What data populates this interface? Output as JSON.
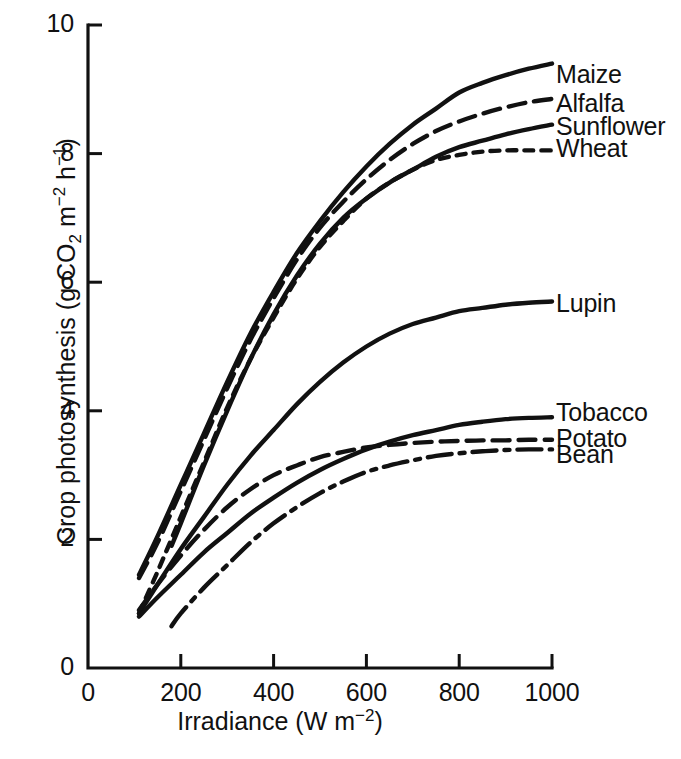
{
  "chart_data": {
    "type": "line",
    "title": "",
    "xlabel": "Irradiance (W m−2)",
    "ylabel": "Crop photosynthesis (g CO2 m−2 h−1)",
    "xlim": [
      0,
      1000
    ],
    "ylim": [
      0,
      10
    ],
    "xticks": [
      0,
      200,
      400,
      600,
      800,
      1000
    ],
    "yticks": [
      0,
      2,
      4,
      6,
      8,
      10
    ],
    "xtick_labels": [
      "0",
      "200",
      "400",
      "600",
      "800",
      "1000"
    ],
    "ytick_labels": [
      "0",
      "2",
      "4",
      "6",
      "8",
      "10"
    ],
    "grid": false,
    "legend_position": "right-of-curve-ends",
    "units": {
      "x": "W m-2",
      "y": "g CO2 m-2 h-1"
    },
    "series": [
      {
        "name": "Maize",
        "line_style": "solid",
        "label_x": 1010,
        "label_y": 9.2,
        "x": [
          110,
          150,
          200,
          250,
          300,
          350,
          400,
          450,
          500,
          550,
          600,
          650,
          700,
          750,
          800,
          850,
          900,
          950,
          1000
        ],
        "y": [
          1.45,
          2.05,
          2.85,
          3.65,
          4.45,
          5.2,
          5.85,
          6.45,
          6.95,
          7.4,
          7.8,
          8.15,
          8.45,
          8.7,
          8.95,
          9.1,
          9.22,
          9.32,
          9.4
        ]
      },
      {
        "name": "Alfalfa",
        "line_style": "dashed",
        "label_x": 1010,
        "label_y": 8.75,
        "x": [
          110,
          150,
          200,
          250,
          300,
          350,
          400,
          450,
          500,
          550,
          600,
          650,
          700,
          750,
          800,
          850,
          900,
          950,
          1000
        ],
        "y": [
          1.4,
          1.95,
          2.75,
          3.55,
          4.35,
          5.1,
          5.75,
          6.35,
          6.85,
          7.25,
          7.6,
          7.9,
          8.15,
          8.35,
          8.5,
          8.62,
          8.72,
          8.8,
          8.85
        ]
      },
      {
        "name": "Sunflower",
        "line_style": "solid",
        "label_x": 1010,
        "label_y": 8.4,
        "x": [
          180,
          200,
          250,
          300,
          350,
          400,
          450,
          500,
          550,
          600,
          650,
          700,
          750,
          800,
          850,
          900,
          950,
          1000
        ],
        "y": [
          1.9,
          2.25,
          3.15,
          4.0,
          4.8,
          5.5,
          6.1,
          6.6,
          7.0,
          7.3,
          7.55,
          7.75,
          7.95,
          8.1,
          8.2,
          8.3,
          8.38,
          8.45
        ]
      },
      {
        "name": "Wheat",
        "line_style": "short-dash",
        "label_x": 1010,
        "label_y": 8.05,
        "x": [
          110,
          150,
          200,
          250,
          300,
          350,
          400,
          450,
          500,
          550,
          600,
          650,
          700,
          750,
          800,
          850,
          900,
          950,
          1000
        ],
        "y": [
          0.85,
          1.5,
          2.35,
          3.2,
          4.05,
          4.8,
          5.45,
          6.05,
          6.55,
          6.95,
          7.3,
          7.55,
          7.75,
          7.9,
          7.98,
          8.03,
          8.05,
          8.05,
          8.05
        ]
      },
      {
        "name": "Lupin",
        "line_style": "solid",
        "label_x": 1010,
        "label_y": 5.65,
        "x": [
          110,
          150,
          200,
          250,
          300,
          350,
          400,
          450,
          500,
          550,
          600,
          650,
          700,
          750,
          800,
          850,
          900,
          950,
          1000
        ],
        "y": [
          0.85,
          1.3,
          1.85,
          2.35,
          2.85,
          3.3,
          3.7,
          4.1,
          4.45,
          4.75,
          5.0,
          5.2,
          5.35,
          5.45,
          5.55,
          5.6,
          5.65,
          5.68,
          5.7
        ]
      },
      {
        "name": "Tobacco",
        "line_style": "solid",
        "label_x": 1010,
        "label_y": 3.95,
        "x": [
          110,
          150,
          200,
          250,
          300,
          350,
          400,
          450,
          500,
          550,
          600,
          650,
          700,
          750,
          800,
          850,
          900,
          950,
          1000
        ],
        "y": [
          0.8,
          1.1,
          1.45,
          1.8,
          2.1,
          2.4,
          2.65,
          2.88,
          3.08,
          3.25,
          3.4,
          3.52,
          3.62,
          3.7,
          3.78,
          3.83,
          3.87,
          3.89,
          3.9
        ]
      },
      {
        "name": "Potato",
        "line_style": "dashed",
        "label_x": 1010,
        "label_y": 3.55,
        "x": [
          110,
          150,
          200,
          250,
          300,
          350,
          400,
          450,
          500,
          550,
          600,
          650,
          700,
          750,
          800,
          850,
          900,
          950,
          1000
        ],
        "y": [
          0.9,
          1.3,
          1.75,
          2.15,
          2.5,
          2.78,
          3.0,
          3.15,
          3.28,
          3.36,
          3.43,
          3.47,
          3.5,
          3.52,
          3.53,
          3.54,
          3.54,
          3.55,
          3.55
        ]
      },
      {
        "name": "Bean",
        "line_style": "dash-dot",
        "label_x": 1010,
        "label_y": 3.3,
        "x": [
          180,
          200,
          250,
          300,
          350,
          400,
          450,
          500,
          550,
          600,
          650,
          700,
          750,
          800,
          850,
          900,
          950,
          1000
        ],
        "y": [
          0.65,
          0.85,
          1.25,
          1.6,
          1.95,
          2.25,
          2.5,
          2.72,
          2.9,
          3.05,
          3.15,
          3.23,
          3.3,
          3.34,
          3.37,
          3.39,
          3.4,
          3.4
        ]
      }
    ]
  },
  "axes": {
    "x_title_text": "Irradiance (W m",
    "x_title_sup": "−2",
    "x_title_tail": ")",
    "y_title_pre": "Crop photosynthesis (g CO",
    "y_title_sub": "2",
    "y_title_mid": " m",
    "y_title_sup1": "−2",
    "y_title_mid2": " h",
    "y_title_sup2": "−1",
    "y_title_tail": ")"
  }
}
